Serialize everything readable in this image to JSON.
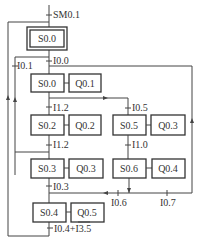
{
  "diagram": {
    "type": "sequential function chart",
    "initial_transition": "SM0.1",
    "steps": [
      {
        "id": "initial",
        "label": "S0.0",
        "action": null
      },
      {
        "id": "s00",
        "label": "S0.0",
        "action": "Q0.1"
      },
      {
        "id": "s02",
        "label": "S0.2",
        "action": "Q0.2"
      },
      {
        "id": "s05",
        "label": "S0.5",
        "action": "Q0.3"
      },
      {
        "id": "s03",
        "label": "S0.3",
        "action": "Q0.3"
      },
      {
        "id": "s06",
        "label": "S0.6",
        "action": "Q0.4"
      },
      {
        "id": "s04",
        "label": "S0.4",
        "action": "Q0.5"
      }
    ],
    "transitions": {
      "t_sm01": "SM0.1",
      "t_i01": "I0.1",
      "t_i00": "I0.0",
      "t_i12a": "I1.2",
      "t_i05": "I0.5",
      "t_i10": "I1.0",
      "t_i12b": "I1.2",
      "t_i03": "I0.3",
      "t_i06": "I0.6",
      "t_i07": "I0.7",
      "t_last_a": "I0.4+",
      "t_last_b": "I3.5"
    },
    "colors": {
      "line": "#444444",
      "text": "#333333",
      "background": "#ffffff"
    }
  }
}
